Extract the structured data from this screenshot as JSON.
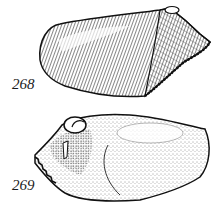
{
  "figures": [
    {
      "label": "268",
      "subject": "shell-lateral-view-hatched"
    },
    {
      "label": "269",
      "subject": "shell-view-stippled"
    }
  ],
  "colors": {
    "ink": "#111111",
    "paper": "#ffffff"
  }
}
